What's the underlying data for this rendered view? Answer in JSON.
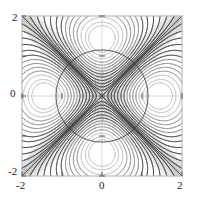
{
  "figure": {
    "title": "",
    "background_color": "#ffffff",
    "frame_color": "#b4b4b4",
    "grid_color": "#d2d2d2",
    "contour_color_dark": "#3c3c3c",
    "contour_color_mid": "#6e6e6e",
    "contour_color_light": "#a8a8a8"
  },
  "axes": {
    "x_ticks": [
      "-2",
      "",
      "0",
      "",
      "2"
    ],
    "y_ticks": [
      "-2",
      "",
      "0",
      "",
      "2"
    ],
    "x_tick_values": [
      -2,
      -1,
      0,
      1,
      2
    ],
    "y_tick_values": [
      -2,
      -1,
      0,
      1,
      2
    ],
    "x_labels_visible": [
      "-2",
      "0",
      "2"
    ],
    "y_labels_visible": [
      "-2",
      "0",
      "2"
    ],
    "xlim": [
      -2,
      2
    ],
    "ylim": [
      -2,
      2
    ],
    "xlabel": "",
    "ylabel": ""
  },
  "labels": {
    "y_top": "2",
    "y_mid": "0",
    "y_bot": "-2",
    "x_left": "-2",
    "x_mid": "0",
    "x_right": "2"
  },
  "chart_data": {
    "type": "line",
    "title": "",
    "xlabel": "",
    "ylabel": "",
    "xlim": [
      -2,
      2
    ],
    "ylim": [
      -2,
      2
    ],
    "grid": true,
    "legend": "none",
    "features": [
      {
        "name": "separatrix-diagonal-up",
        "type": "line",
        "points": [
          [
            -2,
            -2
          ],
          [
            2,
            2
          ]
        ]
      },
      {
        "name": "separatrix-diagonal-down",
        "type": "line",
        "points": [
          [
            -2,
            2
          ],
          [
            2,
            -2
          ]
        ]
      },
      {
        "name": "outer-closed-curve",
        "type": "closed",
        "center": [
          0,
          0
        ],
        "radius": 1.15
      },
      {
        "name": "upper-oval-family",
        "type": "nested-closed",
        "center": [
          0,
          0.62
        ],
        "count": 11,
        "outer_half_width": 0.82,
        "outer_half_height": 0.52
      },
      {
        "name": "lower-oval-family",
        "type": "nested-closed",
        "center": [
          0,
          -0.62
        ],
        "count": 11,
        "outer_half_width": 0.82,
        "outer_half_height": 0.52
      },
      {
        "name": "left-hyperbolic-branches",
        "type": "branch-family",
        "count": 12,
        "vertex_x_range": [
          -1.4,
          -1.05
        ],
        "endpoints": [
          [
            -2,
            2
          ],
          [
            -2,
            -2
          ]
        ]
      },
      {
        "name": "right-hyperbolic-branches",
        "type": "branch-family",
        "count": 12,
        "vertex_x_range": [
          1.05,
          1.4
        ],
        "endpoints": [
          [
            2,
            2
          ],
          [
            2,
            -2
          ]
        ]
      }
    ],
    "series": [
      {
        "name": "level-curves",
        "levels": [
          0.0,
          0.1,
          0.2,
          0.3,
          0.4,
          0.5,
          0.6,
          0.7,
          0.8,
          0.9,
          1.0
        ],
        "values": []
      }
    ]
  }
}
